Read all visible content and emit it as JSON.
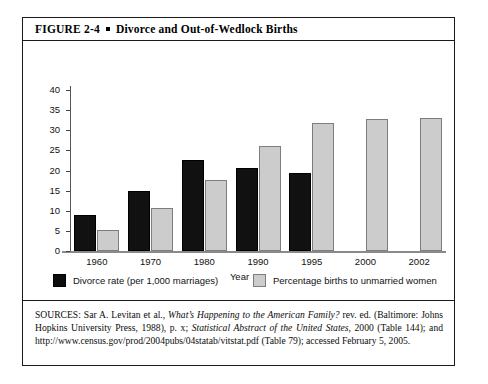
{
  "figure": {
    "label": "FIGURE 2-4",
    "bullet": "square-bullet",
    "title": "Divorce and Out-of-Wedlock Births"
  },
  "chart_data": {
    "type": "bar",
    "title": "Divorce and Out-of-Wedlock Births",
    "xlabel": "Year",
    "ylabel": "",
    "ylim": [
      0,
      40
    ],
    "yticks": [
      "0",
      "5",
      "10",
      "15",
      "20",
      "25",
      "30",
      "35",
      "40"
    ],
    "grid": false,
    "legend_position": "bottom",
    "categories": [
      "1960",
      "1970",
      "1980",
      "1990",
      "1995",
      "2000",
      "2002"
    ],
    "series": [
      {
        "name": "Divorce rate (per 1,000 marriages)",
        "color": "#111111",
        "values": [
          9.0,
          15.0,
          22.6,
          20.7,
          19.3,
          null,
          null
        ]
      },
      {
        "name": "Percentage births to unmarried women",
        "color": "#cccccc",
        "values": [
          5.1,
          10.7,
          17.6,
          26.0,
          31.7,
          32.8,
          33.1
        ]
      }
    ]
  },
  "legend": {
    "entries": [
      {
        "label": "Divorce rate (per 1,000 marriages)",
        "swatch": "dark"
      },
      {
        "label": "Percentage births to unmarried women",
        "swatch": "light"
      }
    ]
  },
  "sources": {
    "prefix": "SOURCES: Sar A. Levitan et al.,",
    "italic_1": "What’s Happening to the American Family?",
    "middle_1": "rev. ed. (Baltimore: Johns Hopkins University Press, 1988), p. x;",
    "italic_2": "Statistical Abstract of the United States,",
    "middle_2": "2000 (Table 144); and http://www.census.gov/prod/2004pubs/04statab/vitstat.pdf (Table 79); accessed February 5, 2005.",
    "full_text": "SOURCES: Sar A. Levitan et al., What’s Happening to the American Family? rev. ed. (Baltimore: Johns Hopkins University Press, 1988), p. x; Statistical Abstract of the United States, 2000 (Table 144); and http://www.census.gov/prod/2004pubs/04statab/vitstat.pdf (Table 79); accessed February 5, 2005."
  }
}
